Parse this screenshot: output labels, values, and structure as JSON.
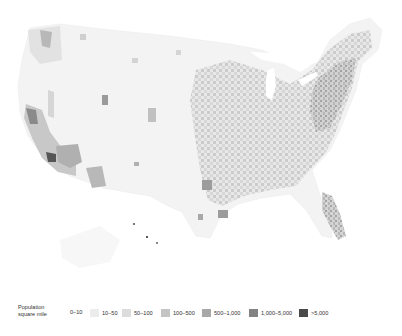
{
  "map": {
    "subject": "United States population density by county",
    "colors": [
      "#f4f4f4",
      "#e9e9e9",
      "#dadada",
      "#c6c6c6",
      "#aaaaaa",
      "#868686",
      "#555555"
    ]
  },
  "legend": {
    "title_line1": "Population",
    "title_line2": "square mile",
    "items": [
      {
        "label": "0–10",
        "color": "#f7f7f7"
      },
      {
        "label": "10–50",
        "color": "#ececec"
      },
      {
        "label": "50–100",
        "color": "#dcdcdc"
      },
      {
        "label": "100–500",
        "color": "#c4c4c4"
      },
      {
        "label": "500–1,000",
        "color": "#a8a8a8"
      },
      {
        "label": "1,000–5,000",
        "color": "#828282"
      },
      {
        "label": ">5,000",
        "color": "#4a4a4a"
      }
    ]
  }
}
